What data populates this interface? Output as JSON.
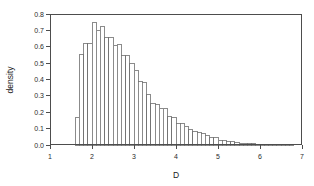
{
  "chart_data": {
    "type": "bar",
    "title": "",
    "subtitle": "",
    "xlabel": "D",
    "ylabel": "density",
    "grid": false,
    "legend": null,
    "legend_position": "none",
    "xlim": [
      1,
      7
    ],
    "ylim": [
      0,
      0.8
    ],
    "xticks": [
      1,
      2,
      3,
      4,
      5,
      6,
      7
    ],
    "xtick_labels": [
      "1",
      "2",
      "3",
      "4",
      "5",
      "6",
      "7"
    ],
    "yticks": [
      0.0,
      0.1,
      0.2,
      0.3,
      0.4,
      0.5,
      0.6,
      0.7,
      0.8
    ],
    "ytick_labels": [
      "0.0",
      "0.1",
      "0.2",
      "0.3",
      "0.4",
      "0.5",
      "0.6",
      "0.7",
      "0.8"
    ],
    "bin_width": 0.1,
    "bin_start": 1.6,
    "bar_fill": "#ffffff",
    "bar_edge": "#6e6e6e",
    "axis_color": "#4d4d4d",
    "categories": [
      "1.6",
      "1.7",
      "1.8",
      "1.9",
      "2.0",
      "2.1",
      "2.2",
      "2.3",
      "2.4",
      "2.5",
      "2.6",
      "2.7",
      "2.8",
      "2.9",
      "3.0",
      "3.1",
      "3.2",
      "3.3",
      "3.4",
      "3.5",
      "3.6",
      "3.7",
      "3.8",
      "3.9",
      "4.0",
      "4.1",
      "4.2",
      "4.3",
      "4.4",
      "4.5",
      "4.6",
      "4.7",
      "4.8",
      "4.9",
      "5.0",
      "5.1",
      "5.2",
      "5.3",
      "5.4",
      "5.5",
      "5.6",
      "5.7",
      "5.8",
      "5.9",
      "6.0",
      "6.1",
      "6.2",
      "6.3",
      "6.4",
      "6.5",
      "6.6",
      "6.7"
    ],
    "values": [
      0.17,
      0.55,
      0.62,
      0.62,
      0.75,
      0.7,
      0.725,
      0.655,
      0.655,
      0.61,
      0.615,
      0.545,
      0.545,
      0.5,
      0.455,
      0.385,
      0.38,
      0.31,
      0.255,
      0.245,
      0.225,
      0.225,
      0.175,
      0.165,
      0.13,
      0.13,
      0.115,
      0.095,
      0.08,
      0.075,
      0.07,
      0.055,
      0.045,
      0.045,
      0.03,
      0.025,
      0.02,
      0.02,
      0.018,
      0.012,
      0.01,
      0.008,
      0.008,
      0.006,
      0.005,
      0.004,
      0.004,
      0.003,
      0.003,
      0.002,
      0.002,
      0.002
    ]
  },
  "figure": {
    "background": "#ffffff",
    "plot_left": 50,
    "plot_right": 302,
    "plot_top": 14,
    "plot_bottom": 145
  }
}
